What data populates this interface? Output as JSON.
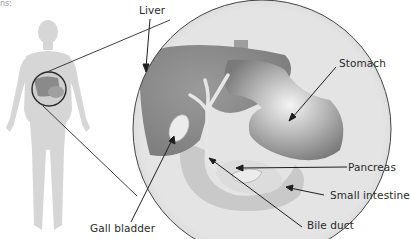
{
  "fragment_text": "ns:",
  "labels": {
    "liver": "Liver",
    "stomach": "Stomach",
    "pancreas": "Pancreas",
    "small_intestine": "Small intestine",
    "gall_bladder": "Gall bladder",
    "bile_duct": "Bile duct"
  },
  "colors": {
    "body_silhouette": "#d6d6d6",
    "circle_bg": "#e2e2e2",
    "liver": "#8c8c8c",
    "stomach": "#a5a5a5",
    "outline": "#333333",
    "text": "#2a2a2a"
  }
}
